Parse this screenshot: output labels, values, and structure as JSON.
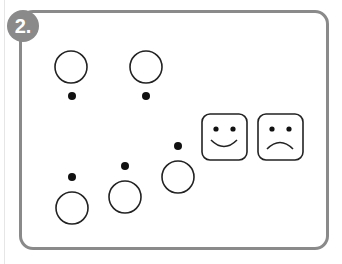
{
  "exercise": {
    "number_label": "2.",
    "frame_color": "#8a8a8a",
    "ink_color": "#222222"
  },
  "items": {
    "top_row": [
      {
        "circle": {
          "cx": 71,
          "cy": 67,
          "r": 16
        },
        "dot": {
          "cx": 72,
          "cy": 96
        },
        "dot_position": "below"
      },
      {
        "circle": {
          "cx": 146,
          "cy": 67,
          "r": 16
        },
        "dot": {
          "cx": 146,
          "cy": 96
        },
        "dot_position": "below"
      }
    ],
    "bottom_row": [
      {
        "circle": {
          "cx": 72,
          "cy": 208,
          "r": 16
        },
        "dot": {
          "cx": 72,
          "cy": 177
        },
        "dot_position": "above"
      },
      {
        "circle": {
          "cx": 125,
          "cy": 197,
          "r": 16
        },
        "dot": {
          "cx": 125,
          "cy": 166
        },
        "dot_position": "above"
      },
      {
        "circle": {
          "cx": 178,
          "cy": 177,
          "r": 16
        },
        "dot": {
          "cx": 178,
          "cy": 146
        },
        "dot_position": "above"
      }
    ]
  },
  "answer_options": [
    {
      "name": "happy-face",
      "icon": "smiley-face-icon"
    },
    {
      "name": "sad-face",
      "icon": "sad-face-icon"
    }
  ]
}
